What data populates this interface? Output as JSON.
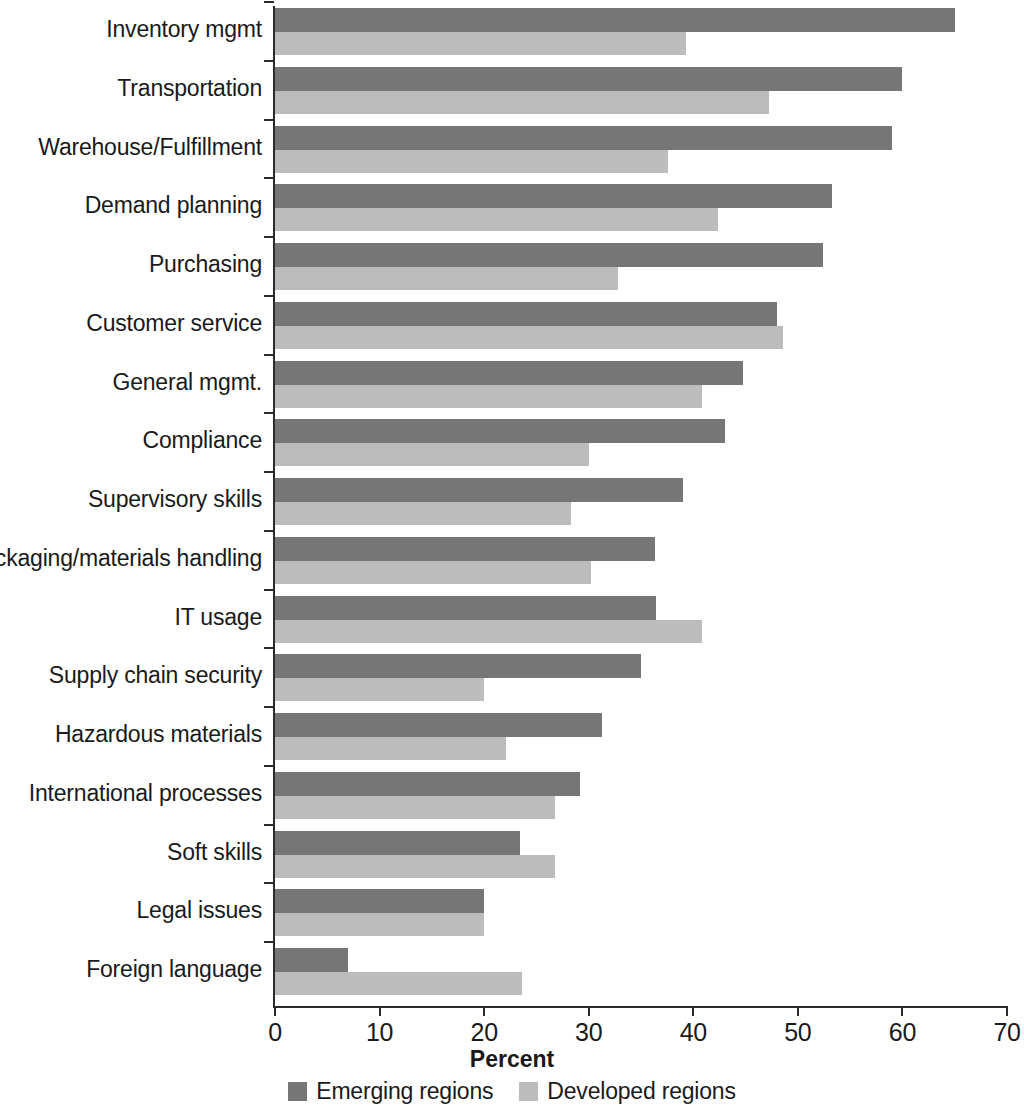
{
  "chart_data": {
    "type": "bar",
    "orientation": "horizontal",
    "title": "",
    "xlabel": "Percent",
    "ylabel": "",
    "xlim": [
      0,
      70
    ],
    "xticks": [
      0,
      10,
      20,
      30,
      40,
      50,
      60,
      70
    ],
    "xtick_labels": [
      "0",
      "10",
      "20",
      "30",
      "40",
      "50",
      "60",
      "70"
    ],
    "grid": false,
    "legend_position": "bottom",
    "categories": [
      "Inventory mgmt",
      "Transportation",
      "Warehouse/Fulfillment",
      "Demand planning",
      "Purchasing",
      "Customer service",
      "General mgmt.",
      "Compliance",
      "Supervisory skills",
      "Packaging/materials handling",
      "IT usage",
      "Supply chain security",
      "Hazardous materials",
      "International processes",
      "Soft skills",
      "Legal issues",
      "Foreign language"
    ],
    "series": [
      {
        "name": "Emerging regions",
        "color": "#767676",
        "values": [
          65,
          60,
          59,
          53.3,
          52.4,
          48,
          44.8,
          43,
          39,
          36.3,
          36.4,
          35,
          31.3,
          29.2,
          23.4,
          20,
          7
        ]
      },
      {
        "name": "Developed regions",
        "color": "#bcbcbc",
        "values": [
          39.3,
          47.2,
          37.6,
          42.4,
          32.8,
          48.6,
          40.8,
          30,
          28.3,
          30.2,
          40.8,
          20,
          22.1,
          26.8,
          26.8,
          20,
          23.6
        ]
      }
    ]
  },
  "legend": {
    "items": [
      {
        "label": "Emerging regions",
        "swatch": "emerging"
      },
      {
        "label": "Developed regions",
        "swatch": "developed"
      }
    ]
  },
  "axis": {
    "x_title": "Percent"
  }
}
